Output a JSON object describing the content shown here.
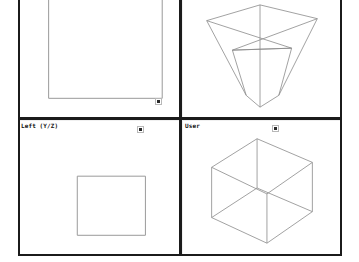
{
  "app": {
    "kind": "3d-modeling-viewport",
    "background": "#ffffff",
    "wire_color": "#8a8a8a",
    "frame_color": "#1b1b1b",
    "label_color": "#101010",
    "marker_color": "#2a2a2a"
  },
  "panes": [
    {
      "id": "top-left",
      "label": "",
      "label_visible": false,
      "content": "orthographic-rectangle-clipped",
      "marker": true
    },
    {
      "id": "top-right",
      "label": "",
      "label_visible": false,
      "content": "perspective-cube-from-above",
      "marker": false
    },
    {
      "id": "bottom-left",
      "label": "Left (Y/Z)",
      "label_visible": true,
      "content": "orthographic-rectangle",
      "marker": true
    },
    {
      "id": "bottom-right",
      "label": "User",
      "label_visible": true,
      "content": "isometric-cube",
      "marker": true
    }
  ]
}
